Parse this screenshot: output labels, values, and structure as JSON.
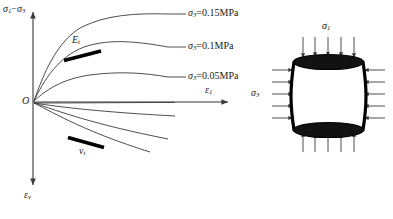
{
  "figure": {
    "background_color": "#ffffff",
    "line_color": "#3a3a3a",
    "text_color": "#1a1a1a",
    "accent_color": "#000000"
  },
  "plot": {
    "axes": {
      "y_positive_label_sigma1": "σ",
      "y_positive_label_sub1": "1",
      "y_positive_label_minus": "−",
      "y_positive_label_sigma3": "σ",
      "y_positive_label_sub3": "3",
      "y_positive_label_full": "σ₁−σ₃",
      "x_label_eps": "ε",
      "x_label_sub": "1",
      "x_label_full": "ε₁",
      "y_negative_label_eps": "ε",
      "y_negative_label_sub": "v",
      "y_negative_label_full": "εᵥ",
      "origin_label": "O"
    },
    "curve_labels": [
      {
        "sigma": "σ",
        "sub": "3",
        "value": "=0.15MPa",
        "full": "σ₃=0.15MPa"
      },
      {
        "sigma": "σ",
        "sub": "3",
        "value": "=0.1MPa",
        "full": "σ₃=0.1MPa"
      },
      {
        "sigma": "σ",
        "sub": "3",
        "value": "=0.05MPa",
        "full": "σ₃=0.05MPa"
      }
    ],
    "annotations": [
      {
        "symbol": "E",
        "sub": "t",
        "full": "Eₜ",
        "meaning": "tangent-modulus"
      },
      {
        "symbol": "ν",
        "sub": "t",
        "full": "νₜ",
        "meaning": "tangent-poisson-ratio"
      }
    ]
  },
  "specimen": {
    "top_stress_label_sym": "σ",
    "top_stress_label_sub": "1",
    "top_stress_label_full": "σ₁",
    "side_stress_label_sym": "σ",
    "side_stress_label_sub": "3",
    "side_stress_label_full": "σ₃",
    "arrow_counts": {
      "top": 5,
      "bottom": 5,
      "left": 5,
      "right": 5
    },
    "shape": "cylinder"
  }
}
